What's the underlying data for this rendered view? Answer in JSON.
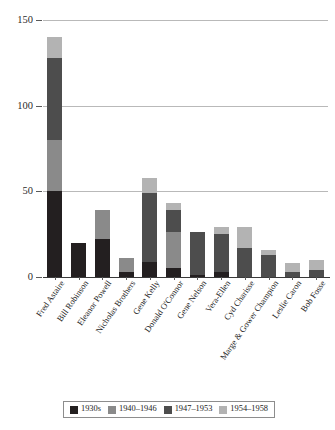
{
  "chart_data": {
    "type": "bar",
    "subtype": "stacked-bar",
    "title": "",
    "subtitle": "",
    "xlabel": "",
    "ylabel": "",
    "ylim": [
      0,
      150
    ],
    "yticks": [
      0,
      50,
      100,
      150
    ],
    "ytick_labels": [
      "0",
      "50",
      "100",
      "150"
    ],
    "grid": true,
    "grid_axis": "y",
    "legend_position": "bottom",
    "categories": [
      "Fred Astaire",
      "Bill Robinson",
      "Eleanor Powell",
      "Nicholas Brothers",
      "Gene Kelly",
      "Donald O'Connor",
      "Gene Nelson",
      "Vera-Ellen",
      "Cyd Charisse",
      "Marge & Gower Champion",
      "Leslie Caron",
      "Bob Fosse"
    ],
    "series": [
      {
        "name": "1930s",
        "color": "#231f20",
        "values": [
          50,
          20,
          22,
          3,
          9,
          5,
          1,
          3,
          0,
          0,
          0,
          0
        ]
      },
      {
        "name": "1940–1946",
        "color": "#8a8a8a",
        "values": [
          30,
          0,
          17,
          8,
          0,
          21,
          0,
          0,
          0,
          0,
          0,
          0
        ]
      },
      {
        "name": "1947–1953",
        "color": "#4d4d4d",
        "values": [
          48,
          0,
          0,
          0,
          40,
          13,
          25,
          22,
          17,
          13,
          3,
          4
        ]
      },
      {
        "name": "1954–1958",
        "color": "#b3b3b3",
        "values": [
          12,
          0,
          0,
          0,
          9,
          4,
          0,
          4,
          12,
          3,
          5,
          6
        ]
      }
    ],
    "totals": [
      140,
      20,
      39,
      11,
      58,
      43,
      26,
      29,
      29,
      16,
      8,
      10
    ]
  },
  "legend": {
    "items": [
      {
        "label": "1930s",
        "color": "#231f20"
      },
      {
        "label": "1940–1946",
        "color": "#8a8a8a"
      },
      {
        "label": "1947–1953",
        "color": "#4d4d4d"
      },
      {
        "label": "1954–1958",
        "color": "#b3b3b3"
      }
    ]
  },
  "colors": {
    "background": "#ffffff",
    "gridline": "#b9b9b9",
    "axis": "#3a3a3a",
    "text": "#1f1f1f"
  }
}
